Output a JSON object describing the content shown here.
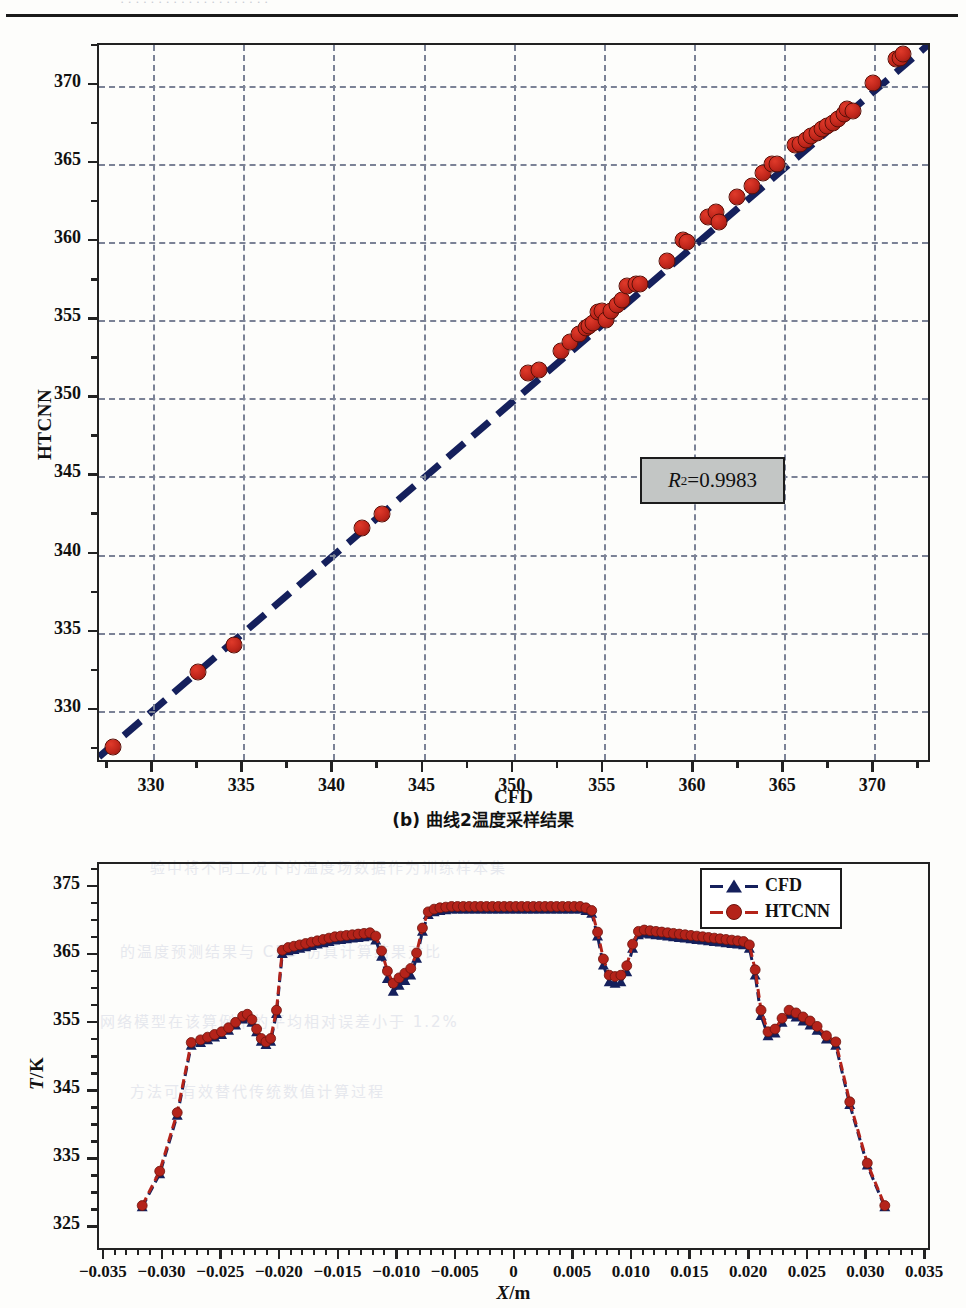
{
  "page": {
    "top_clipped_text": "· · · · · · · · · · · · · · · · · · · ·",
    "figure_caption_b": "(b) 曲线2温度采样结果",
    "bleed_lines": [
      "验中将不同工况下的温度场数据作为训练样本集",
      "的温度预测结果与 CFD 仿真计算结果对比",
      "网络模型在该算例中的平均相对误差小于 1.2%",
      "方法可有效替代传统数值计算过程"
    ]
  },
  "chart_data": [
    {
      "id": "parity",
      "type": "scatter",
      "title": "",
      "xlabel": "CFD",
      "ylabel": "HTCNN",
      "xlim": [
        327.0,
        373.2
      ],
      "ylim": [
        326.6,
        372.6
      ],
      "xticks": [
        330,
        335,
        340,
        345,
        350,
        355,
        360,
        365,
        370
      ],
      "yticks": [
        330,
        335,
        340,
        345,
        350,
        355,
        360,
        365,
        370
      ],
      "grid": true,
      "minor_ticks": true,
      "annotation": {
        "label_r": "R",
        "label_sup": "2",
        "label_rest": "=0.9983",
        "value": 0.9983
      },
      "fit_line": {
        "x": [
          327.0,
          373.2
        ],
        "y": [
          326.8,
          372.6
        ],
        "style": "dashed",
        "color": "#15205c"
      },
      "marker_color": "#c0261b",
      "points": [
        [
          327.8,
          327.7
        ],
        [
          332.5,
          332.5
        ],
        [
          334.5,
          334.2
        ],
        [
          341.6,
          341.7
        ],
        [
          342.7,
          342.6
        ],
        [
          350.8,
          351.6
        ],
        [
          351.4,
          351.8
        ],
        [
          352.6,
          353.0
        ],
        [
          353.1,
          353.6
        ],
        [
          353.6,
          354.1
        ],
        [
          354.0,
          354.5
        ],
        [
          354.2,
          354.6
        ],
        [
          354.4,
          354.8
        ],
        [
          354.7,
          355.5
        ],
        [
          354.9,
          355.6
        ],
        [
          355.1,
          355.0
        ],
        [
          355.4,
          355.6
        ],
        [
          355.7,
          356.0
        ],
        [
          356.0,
          356.3
        ],
        [
          356.3,
          357.2
        ],
        [
          356.8,
          357.3
        ],
        [
          357.0,
          357.3
        ],
        [
          358.5,
          358.8
        ],
        [
          359.4,
          360.1
        ],
        [
          359.6,
          360.0
        ],
        [
          360.8,
          361.6
        ],
        [
          361.2,
          361.9
        ],
        [
          361.4,
          361.3
        ],
        [
          362.4,
          362.9
        ],
        [
          363.2,
          363.6
        ],
        [
          363.8,
          364.4
        ],
        [
          364.3,
          365.0
        ],
        [
          364.6,
          365.0
        ],
        [
          365.6,
          366.2
        ],
        [
          365.9,
          366.3
        ],
        [
          366.2,
          366.5
        ],
        [
          366.5,
          366.8
        ],
        [
          366.8,
          367.0
        ],
        [
          367.1,
          367.2
        ],
        [
          367.4,
          367.4
        ],
        [
          367.7,
          367.6
        ],
        [
          368.0,
          367.9
        ],
        [
          368.3,
          368.2
        ],
        [
          368.5,
          368.5
        ],
        [
          368.8,
          368.4
        ],
        [
          369.9,
          370.2
        ],
        [
          371.2,
          371.7
        ],
        [
          371.4,
          371.8
        ],
        [
          371.6,
          372.0
        ]
      ]
    },
    {
      "id": "profile",
      "type": "line",
      "title": "",
      "xlabel": "X/m",
      "xlabel_italic": "X",
      "xlabel_rest": "/m",
      "ylabel": "T/K",
      "ylabel_italic": "T",
      "ylabel_rest": "/K",
      "xlim": [
        -0.0355,
        0.0355
      ],
      "ylim": [
        321.5,
        378.5
      ],
      "xticks": [
        -0.035,
        -0.03,
        -0.025,
        -0.02,
        -0.015,
        -0.01,
        -0.005,
        0,
        0.005,
        0.01,
        0.015,
        0.02,
        0.025,
        0.03,
        0.035
      ],
      "xticklabels": [
        "−0.035",
        "−0.030",
        "−0.025",
        "−0.020",
        "−0.015",
        "−0.010",
        "−0.005",
        "0",
        "0.005",
        "0.010",
        "0.015",
        "0.020",
        "0.025",
        "0.030",
        "0.035"
      ],
      "yticks": [
        325,
        335,
        345,
        355,
        365,
        375
      ],
      "grid": false,
      "minor_ticks": true,
      "legend_position": "top-right",
      "series": [
        {
          "name": "CFD",
          "color": "#15205c",
          "marker": "triangle",
          "linestyle": "dashed",
          "x": [
            -0.0318,
            -0.0303,
            -0.0288,
            -0.0276,
            -0.0268,
            -0.0262,
            -0.0256,
            -0.025,
            -0.0244,
            -0.0238,
            -0.0232,
            -0.0228,
            -0.0224,
            -0.022,
            -0.0216,
            -0.0212,
            -0.0208,
            -0.0203,
            -0.0198,
            -0.0193,
            -0.0188,
            -0.0183,
            -0.0178,
            -0.0173,
            -0.0168,
            -0.0163,
            -0.0158,
            -0.0153,
            -0.0148,
            -0.0143,
            -0.0138,
            -0.0133,
            -0.0128,
            -0.0123,
            -0.0118,
            -0.0113,
            -0.0108,
            -0.0103,
            -0.0098,
            -0.0093,
            -0.0088,
            -0.0083,
            -0.0078,
            -0.0073,
            -0.0068,
            -0.0063,
            -0.0058,
            -0.0053,
            -0.0048,
            -0.0043,
            -0.0038,
            -0.0033,
            -0.0028,
            -0.0023,
            -0.0018,
            -0.0013,
            -0.0008,
            -0.0003,
            0.0002,
            0.0007,
            0.0012,
            0.0017,
            0.0022,
            0.0027,
            0.0032,
            0.0037,
            0.0042,
            0.0047,
            0.0052,
            0.0057,
            0.0062,
            0.0067,
            0.0072,
            0.0077,
            0.0082,
            0.0087,
            0.0092,
            0.0097,
            0.0102,
            0.0107,
            0.0112,
            0.0117,
            0.0122,
            0.0127,
            0.0132,
            0.0137,
            0.0142,
            0.0147,
            0.0152,
            0.0157,
            0.0162,
            0.0167,
            0.0172,
            0.0177,
            0.0182,
            0.0187,
            0.0192,
            0.0197,
            0.0202,
            0.0207,
            0.0212,
            0.0218,
            0.0224,
            0.023,
            0.0236,
            0.0242,
            0.0248,
            0.0254,
            0.026,
            0.0268,
            0.0276,
            0.0288,
            0.0303,
            0.0318
          ],
          "y": [
            327.6,
            332.5,
            341.2,
            351.6,
            352.0,
            352.4,
            352.8,
            353.2,
            353.8,
            354.6,
            355.5,
            355.8,
            355.0,
            353.6,
            352.2,
            351.7,
            352.2,
            356.3,
            365.2,
            365.6,
            365.8,
            366.0,
            366.2,
            366.4,
            366.6,
            366.8,
            367.0,
            367.2,
            367.3,
            367.4,
            367.5,
            367.6,
            367.7,
            367.8,
            367.2,
            364.8,
            361.5,
            359.6,
            360.5,
            361.2,
            362.0,
            364.5,
            368.5,
            371.0,
            371.4,
            371.6,
            371.7,
            371.8,
            371.8,
            371.8,
            371.8,
            371.8,
            371.8,
            371.8,
            371.8,
            371.8,
            371.8,
            371.8,
            371.8,
            371.8,
            371.8,
            371.8,
            371.8,
            371.8,
            371.8,
            371.8,
            371.8,
            371.8,
            371.8,
            371.8,
            371.6,
            371.2,
            367.8,
            363.5,
            361.0,
            360.8,
            361.0,
            362.5,
            366.0,
            368.0,
            368.2,
            368.1,
            368.0,
            367.9,
            367.8,
            367.7,
            367.6,
            367.5,
            367.4,
            367.3,
            367.2,
            367.1,
            367.0,
            366.9,
            366.8,
            366.7,
            366.6,
            366.5,
            366.0,
            362.0,
            356.0,
            353.0,
            353.4,
            355.0,
            356.2,
            355.8,
            355.2,
            354.6,
            353.8,
            352.5,
            351.6,
            342.8,
            333.8,
            327.6
          ]
        },
        {
          "name": "HTCNN",
          "color": "#b4231a",
          "marker": "circle",
          "linestyle": "dashed",
          "x": [
            -0.0318,
            -0.0303,
            -0.0288,
            -0.0276,
            -0.0268,
            -0.0262,
            -0.0256,
            -0.025,
            -0.0244,
            -0.0238,
            -0.0232,
            -0.0228,
            -0.0224,
            -0.022,
            -0.0216,
            -0.0212,
            -0.0208,
            -0.0203,
            -0.0198,
            -0.0193,
            -0.0188,
            -0.0183,
            -0.0178,
            -0.0173,
            -0.0168,
            -0.0163,
            -0.0158,
            -0.0153,
            -0.0148,
            -0.0143,
            -0.0138,
            -0.0133,
            -0.0128,
            -0.0123,
            -0.0118,
            -0.0113,
            -0.0108,
            -0.0103,
            -0.0098,
            -0.0093,
            -0.0088,
            -0.0083,
            -0.0078,
            -0.0073,
            -0.0068,
            -0.0063,
            -0.0058,
            -0.0053,
            -0.0048,
            -0.0043,
            -0.0038,
            -0.0033,
            -0.0028,
            -0.0023,
            -0.0018,
            -0.0013,
            -0.0008,
            -0.0003,
            0.0002,
            0.0007,
            0.0012,
            0.0017,
            0.0022,
            0.0027,
            0.0032,
            0.0037,
            0.0042,
            0.0047,
            0.0052,
            0.0057,
            0.0062,
            0.0067,
            0.0072,
            0.0077,
            0.0082,
            0.0087,
            0.0092,
            0.0097,
            0.0102,
            0.0107,
            0.0112,
            0.0117,
            0.0122,
            0.0127,
            0.0132,
            0.0137,
            0.0142,
            0.0147,
            0.0152,
            0.0157,
            0.0162,
            0.0167,
            0.0172,
            0.0177,
            0.0182,
            0.0187,
            0.0192,
            0.0197,
            0.0202,
            0.0207,
            0.0212,
            0.0218,
            0.0224,
            0.023,
            0.0236,
            0.0242,
            0.0248,
            0.0254,
            0.026,
            0.0268,
            0.0276,
            0.0288,
            0.0303,
            0.0318
          ],
          "y": [
            327.8,
            332.9,
            341.6,
            352.0,
            352.4,
            352.8,
            353.2,
            353.6,
            354.2,
            355.0,
            355.9,
            356.2,
            355.4,
            354.0,
            352.6,
            352.1,
            352.6,
            356.8,
            365.7,
            366.1,
            366.3,
            366.5,
            366.7,
            366.9,
            367.1,
            367.3,
            367.5,
            367.7,
            367.8,
            367.9,
            368.0,
            368.1,
            368.2,
            368.3,
            367.8,
            365.6,
            362.6,
            360.8,
            361.6,
            362.3,
            363.0,
            365.3,
            369.0,
            371.4,
            371.8,
            372.0,
            372.1,
            372.2,
            372.2,
            372.2,
            372.2,
            372.2,
            372.2,
            372.2,
            372.2,
            372.2,
            372.2,
            372.2,
            372.2,
            372.2,
            372.2,
            372.2,
            372.2,
            372.2,
            372.2,
            372.2,
            372.2,
            372.2,
            372.2,
            372.2,
            372.0,
            371.6,
            368.4,
            364.4,
            362.0,
            361.8,
            362.0,
            363.4,
            366.6,
            368.5,
            368.7,
            368.6,
            368.5,
            368.4,
            368.3,
            368.2,
            368.1,
            368.0,
            367.9,
            367.8,
            367.7,
            367.6,
            367.5,
            367.4,
            367.3,
            367.2,
            367.1,
            367.0,
            366.5,
            362.8,
            356.8,
            353.6,
            354.0,
            355.6,
            356.8,
            356.4,
            355.8,
            355.2,
            354.4,
            353.0,
            352.1,
            343.2,
            334.1,
            327.8
          ]
        }
      ]
    }
  ]
}
